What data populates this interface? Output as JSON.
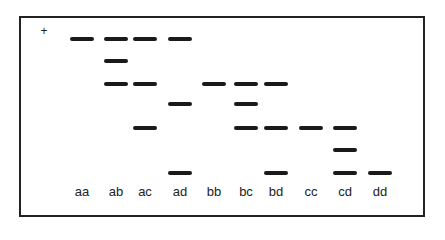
{
  "figure": {
    "polarity_symbol": "+",
    "lanes": [
      {
        "label": "aa",
        "x": 70,
        "bands": [
          1
        ]
      },
      {
        "label": "ab",
        "x": 104,
        "bands": [
          1,
          2,
          3
        ]
      },
      {
        "label": "ac",
        "x": 133,
        "bands": [
          1,
          3,
          5
        ]
      },
      {
        "label": "ad",
        "x": 168,
        "bands": [
          1,
          4,
          7
        ]
      },
      {
        "label": "bb",
        "x": 202,
        "bands": [
          3
        ]
      },
      {
        "label": "bc",
        "x": 234,
        "bands": [
          3,
          4,
          5
        ]
      },
      {
        "label": "bd",
        "x": 264,
        "bands": [
          3,
          5,
          7
        ]
      },
      {
        "label": "cc",
        "x": 299,
        "bands": [
          5
        ]
      },
      {
        "label": "cd",
        "x": 333,
        "bands": [
          5,
          6,
          7
        ]
      },
      {
        "label": "dd",
        "x": 368,
        "bands": [
          7
        ]
      }
    ],
    "band_rows_y": {
      "1": 37,
      "2": 59,
      "3": 82,
      "4": 102,
      "5": 126,
      "6": 148,
      "7": 171
    },
    "colors": {
      "band": "#1a1a1a",
      "frame": "#222222",
      "background": "#ffffff"
    }
  }
}
